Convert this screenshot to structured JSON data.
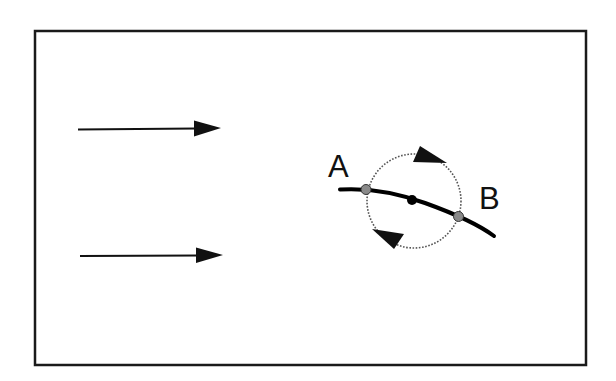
{
  "diagram": {
    "title": "",
    "frame": {
      "x": 35,
      "y": 31,
      "width": 551,
      "height": 334,
      "stroke": "#1a1a1a"
    },
    "flow_arrows": [
      {
        "id": "upper",
        "x1": 78,
        "y1": 129,
        "x2": 221,
        "y2": 128,
        "direction": "right"
      },
      {
        "id": "lower",
        "x1": 80,
        "y1": 256,
        "x2": 223,
        "y2": 255,
        "direction": "right"
      }
    ],
    "curve": {
      "description": "curved line (body) in flow",
      "color": "#000000"
    },
    "circulation_loop": {
      "center": {
        "x": 412,
        "y": 200
      },
      "radius": 46,
      "style": "dotted",
      "direction": "clockwise",
      "color": "#555555"
    },
    "points": [
      {
        "id": "A",
        "label": "A",
        "x": 366,
        "y": 189,
        "fill": "#8a8a8a"
      },
      {
        "id": "center",
        "label": "",
        "x": 412,
        "y": 200,
        "fill": "#000000"
      },
      {
        "id": "B",
        "label": "B",
        "x": 458,
        "y": 216,
        "fill": "#8a8a8a"
      }
    ],
    "labels": {
      "a": "A",
      "b": "B"
    }
  }
}
